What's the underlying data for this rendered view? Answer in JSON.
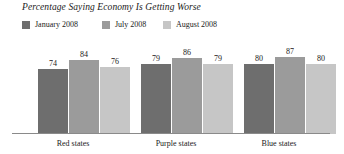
{
  "chart_data": {
    "type": "bar",
    "title": "Percentage Saying Economy Is Getting Worse",
    "xlabel": "",
    "ylabel": "",
    "ylim": [
      0,
      100
    ],
    "grid": false,
    "legend_position": "top-left",
    "categories": [
      "Red states",
      "Purple states",
      "Blue states"
    ],
    "series": [
      {
        "name": "January 2008",
        "color": "#6e6e6e",
        "values": [
          74,
          79,
          80
        ]
      },
      {
        "name": "July 2008",
        "color": "#9b9b9b",
        "values": [
          84,
          86,
          87
        ]
      },
      {
        "name": "August 2008",
        "color": "#c6c6c6",
        "values": [
          76,
          79,
          80
        ]
      }
    ]
  },
  "legend": {
    "items": [
      {
        "label": "January 2008",
        "color": "#6e6e6e",
        "left": 0
      },
      {
        "label": "July 2008",
        "color": "#9b9b9b",
        "left": 80
      },
      {
        "label": "August 2008",
        "color": "#c6c6c6",
        "left": 141
      }
    ]
  },
  "groups": [
    {
      "label": "Red states",
      "left": 38,
      "label_left": 24,
      "label_width": 98,
      "bars": [
        {
          "series": "January 2008",
          "value": "74",
          "color": "#6e6e6e",
          "offset": 0
        },
        {
          "series": "July 2008",
          "value": "84",
          "color": "#9b9b9b",
          "offset": 31
        },
        {
          "series": "August 2008",
          "value": "76",
          "color": "#c6c6c6",
          "offset": 62
        }
      ]
    },
    {
      "label": "Purple states",
      "left": 141,
      "label_left": 127,
      "label_width": 98,
      "bars": [
        {
          "series": "January 2008",
          "value": "79",
          "color": "#6e6e6e",
          "offset": 0
        },
        {
          "series": "July 2008",
          "value": "86",
          "color": "#9b9b9b",
          "offset": 31
        },
        {
          "series": "August 2008",
          "value": "79",
          "color": "#c6c6c6",
          "offset": 62
        }
      ]
    },
    {
      "label": "Blue states",
      "left": 244,
      "label_left": 230,
      "label_width": 98,
      "bars": [
        {
          "series": "January 2008",
          "value": "80",
          "color": "#6e6e6e",
          "offset": 0
        },
        {
          "series": "July 2008",
          "value": "87",
          "color": "#9b9b9b",
          "offset": 31
        },
        {
          "series": "August 2008",
          "value": "80",
          "color": "#c6c6c6",
          "offset": 62
        }
      ]
    }
  ],
  "axis": {
    "baseline_color": "#8a8a8a"
  }
}
